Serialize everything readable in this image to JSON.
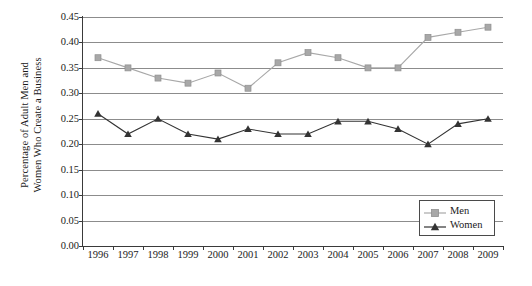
{
  "chart_data": {
    "type": "line",
    "title": "",
    "xlabel": "",
    "ylabel": "Percentage of Adult Men and Women Who Create a Business",
    "ylabel_lines": [
      "Percentage of Adult Men and",
      "Women Who Create a Business"
    ],
    "categories": [
      "1996",
      "1997",
      "1998",
      "1999",
      "2000",
      "2001",
      "2002",
      "2003",
      "2004",
      "2005",
      "2006",
      "2007",
      "2008",
      "2009"
    ],
    "ylim": [
      0.0,
      0.45
    ],
    "yticks": [
      "0.00",
      "0.05",
      "0.10",
      "0.15",
      "0.20",
      "0.25",
      "0.30",
      "0.35",
      "0.40",
      "0.45"
    ],
    "ytick_values": [
      0.0,
      0.05,
      0.1,
      0.15,
      0.2,
      0.25,
      0.3,
      0.35,
      0.4,
      0.45
    ],
    "grid": true,
    "legend_position": "bottom-right",
    "series": [
      {
        "name": "Men",
        "color": "#a8a8a8",
        "marker": "square",
        "values": [
          0.37,
          0.35,
          0.33,
          0.32,
          0.34,
          0.31,
          0.36,
          0.38,
          0.37,
          0.35,
          0.35,
          0.41,
          0.42,
          0.43
        ]
      },
      {
        "name": "Women",
        "color": "#333333",
        "marker": "triangle",
        "values": [
          0.26,
          0.22,
          0.25,
          0.22,
          0.21,
          0.23,
          0.22,
          0.22,
          0.245,
          0.245,
          0.23,
          0.2,
          0.24,
          0.25
        ]
      }
    ]
  },
  "legend": {
    "entries": [
      {
        "label": "Men"
      },
      {
        "label": "Women"
      }
    ]
  },
  "colors": {
    "men": "#a8a8a8",
    "women": "#333333",
    "gridline": "#8c8c8c",
    "axis": "#3a3a3a",
    "background": "#ffffff"
  }
}
